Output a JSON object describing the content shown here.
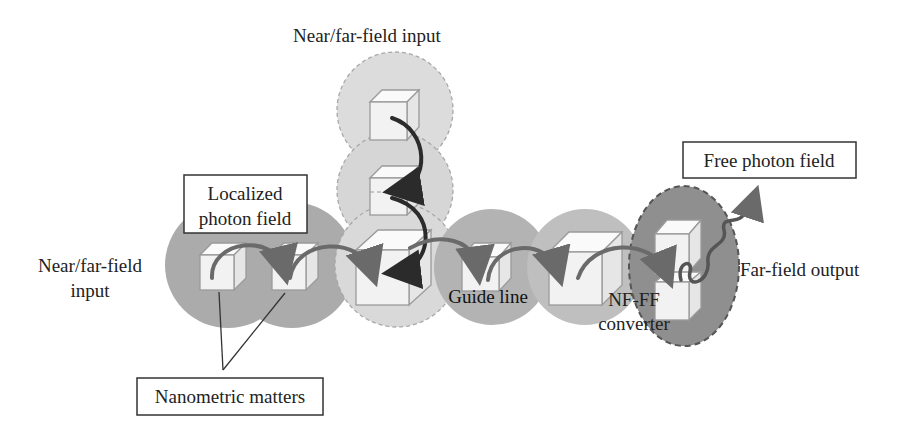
{
  "diagram": {
    "labels": {
      "top_input": "Near/far-field input",
      "left_input_line1": "Near/far-field",
      "left_input_line2": "input",
      "localized_line1": "Localized",
      "localized_line2": "photon field",
      "free_photon": "Free photon field",
      "guide_line": "Guide line",
      "nfff_line1": "NF-FF",
      "nfff_line2": "converter",
      "far_field_output": "Far-field output",
      "nanometric": "Nanometric matters"
    },
    "colors": {
      "field_dark": "#a9a9a9",
      "field_medium": "#bdbdbd",
      "field_light": "#d9d9d9",
      "output_ellipse": "#8f8f8f",
      "arrow_gray": "#6a6a6a",
      "arrow_dark": "#2b2b2b",
      "cube_edge": "#9a9a9a"
    }
  }
}
